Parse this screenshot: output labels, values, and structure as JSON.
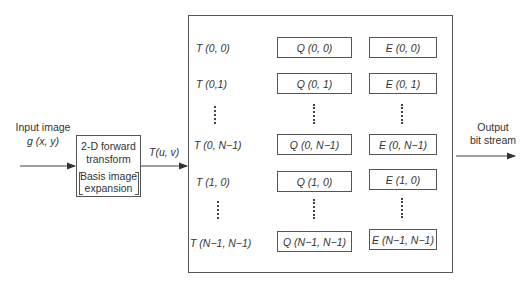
{
  "input": {
    "line1": "Input image",
    "line2": "g (x, y)"
  },
  "transform_box": {
    "line1": "2-D forward",
    "line2": "transform",
    "line3": "Basis image",
    "line4": "expansion"
  },
  "transform_output_label": "T(u, v)",
  "output": {
    "line1": "Output",
    "line2": "bit stream"
  },
  "rows": [
    {
      "t": "T (0, 0)",
      "q": "Q (0, 0)",
      "e": "E (0, 0)"
    },
    {
      "t": "T (0,1)",
      "q": "Q (0, 1)",
      "e": "E (0, 1)"
    },
    {
      "t": "T (0, N−1)",
      "q": "Q (0, N−1)",
      "e": "E (0, N−1)"
    },
    {
      "t": "T (1, 0)",
      "q": "Q (1, 0)",
      "e": "E (1, 0)"
    },
    {
      "t": "T (N−1, N−1)",
      "q": "Q (N−1, N−1)",
      "e": "E (N−1, N−1)"
    }
  ],
  "colors": {
    "line": "#555555",
    "text": "#333333"
  }
}
